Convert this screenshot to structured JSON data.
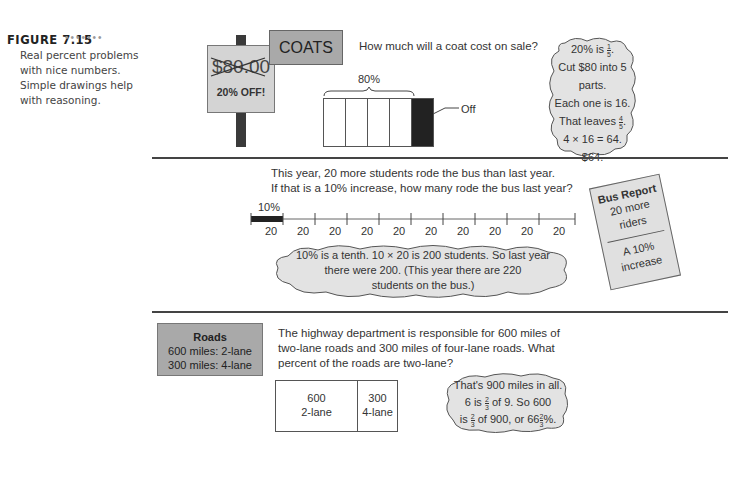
{
  "figure": {
    "label": "FIGURE 7.15",
    "dots": "•••••••",
    "caption": [
      "Real percent problems",
      "with nice numbers.",
      "Simple drawings help",
      "with reasoning."
    ]
  },
  "coats": {
    "sign_price": "$80.00",
    "sign_discount": "20% OFF!",
    "banner": "COATS",
    "question": "How much will a coat cost on sale?",
    "bar_label": "80%",
    "off_label": "Off",
    "cloud": [
      "20% is",
      "Cut $80 into 5 parts.",
      "Each one is 16.",
      "That leaves",
      "4 × 16 = 64.",
      "$64."
    ],
    "fractions": {
      "one_fifth": [
        "1",
        "5"
      ],
      "four_fifths": [
        "4",
        "5"
      ]
    }
  },
  "bus": {
    "question_line1": "This year, 20 more students rode the bus than last year.",
    "question_line2": "If that is a 10% increase, how many rode the bus last year?",
    "segment_label": "10%",
    "segment_values": [
      "20",
      "20",
      "20",
      "20",
      "20",
      "20",
      "20",
      "20",
      "20",
      "20"
    ],
    "cloud": [
      "10% is a tenth. 10 × 20 is 200 students. So last year",
      "there were 200. (This year there are 220",
      "students on the bus.)"
    ],
    "report": {
      "title": "Bus Report",
      "line1": "20 more",
      "line2": "riders",
      "line3": "A 10%",
      "line4": "increase"
    }
  },
  "roads": {
    "box_title": "Roads",
    "box_line1": "600 miles: 2-lane",
    "box_line2": "300 miles: 4-lane",
    "question": [
      "The highway department is responsible for 600 miles of",
      "two-lane roads and 300 miles of four-lane roads. What",
      "percent of the roads are two-lane?"
    ],
    "lanes": [
      {
        "value": "600",
        "label": "2-lane"
      },
      {
        "value": "300",
        "label": "4-lane"
      }
    ],
    "cloud": [
      "That's 900 miles in all.",
      "6 is",
      "of 9. So 600",
      "is",
      "of 900, or 66",
      "%."
    ],
    "fractions": {
      "two_thirds": [
        "2",
        "3"
      ]
    }
  }
}
